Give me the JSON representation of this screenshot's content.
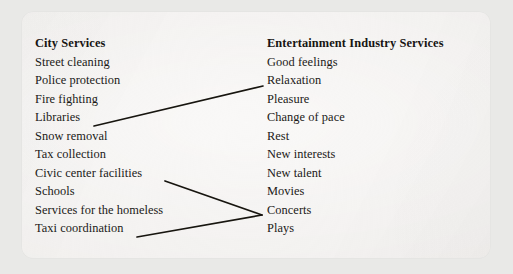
{
  "figure": {
    "card_background": "#f4f2f0",
    "page_background": "#e9e9e7",
    "ink_color": "#1b1917",
    "columns": [
      {
        "id": "city",
        "header": "City Services",
        "items": [
          "Street cleaning",
          "Police protection",
          "Fire fighting",
          "Libraries",
          "Snow removal",
          "Tax collection",
          "Civic center facilities",
          "Schools",
          "Services for the homeless",
          "Taxi coordination"
        ]
      },
      {
        "id": "entertainment",
        "header": "Entertainment Industry Services",
        "items": [
          "Good feelings",
          "Relaxation",
          "Pleasure",
          "Change of pace",
          "Rest",
          "New interests",
          "New talent",
          "Movies",
          "Concerts",
          "Plays"
        ]
      }
    ],
    "connectors": [
      {
        "id": "libraries-to-relaxation",
        "from_label": "Libraries",
        "to_label": "Relaxation",
        "x1": 94,
        "y1": 126,
        "x2": 263,
        "y2": 86
      },
      {
        "id": "civic-center-to-concerts",
        "from_label": "Civic center facilities",
        "to_label": "Concerts",
        "x1": 165,
        "y1": 181,
        "x2": 262,
        "y2": 215
      },
      {
        "id": "taxi-coordination-to-concerts",
        "from_label": "Taxi coordination",
        "to_label": "Concerts",
        "x1": 137,
        "y1": 237,
        "x2": 262,
        "y2": 215
      }
    ]
  }
}
